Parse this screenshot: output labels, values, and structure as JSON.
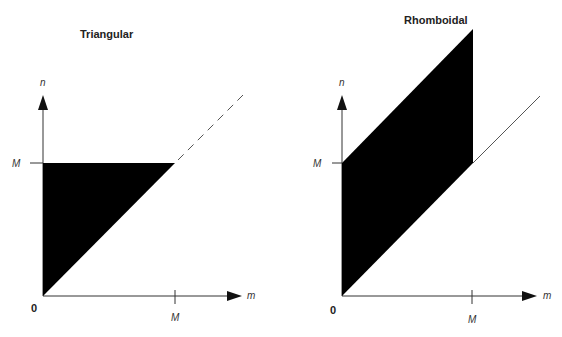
{
  "panels": [
    {
      "title": "Triangular",
      "y_axis_label": "n",
      "x_axis_label": "m",
      "y_tick_label": "M",
      "x_tick_label": "M",
      "origin_label": "0",
      "region": "triangle between n-axis, n=M and diagonal n=m",
      "diagonal_extension": "dashed"
    },
    {
      "title": "Rhomboidal",
      "y_axis_label": "n",
      "x_axis_label": "m",
      "y_tick_label": "M",
      "x_tick_label": "M",
      "origin_label": "0",
      "region": "parallelogram between n=m and n=m+M for 0<=m<=M",
      "diagonal_extension": "solid"
    }
  ],
  "colors": {
    "fill": "#000000",
    "axis": "#333333",
    "background": "#ffffff"
  }
}
